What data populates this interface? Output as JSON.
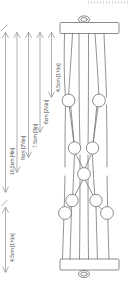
{
  "diagram": {
    "orientation": "rotated-90-ccw",
    "units": "cm [in]",
    "line_color": "#6e6e6e",
    "fill_color": "#ffffff",
    "text_color": "#4a4a4a",
    "background": "#ffffff"
  },
  "dimensions": [
    {
      "id": "dim-1",
      "label": "10.5cm [4in]",
      "cm": 10.5,
      "inches": "4in",
      "span": "overall-upper"
    },
    {
      "id": "dim-2",
      "label": "9cm [3½in]",
      "cm": 9.0,
      "inches": "3½in",
      "span": "to-lower-bead-row"
    },
    {
      "id": "dim-3",
      "label": "7.5cm [3in]",
      "cm": 7.5,
      "inches": "3in",
      "span": "to-centre-bead"
    },
    {
      "id": "dim-4",
      "label": "6cm [2¼in]",
      "cm": 6.0,
      "inches": "2¼in",
      "span": "to-upper-mid-beads"
    },
    {
      "id": "dim-5",
      "label": "4.5cm [1¾in]",
      "cm": 4.5,
      "inches": "1¾in",
      "span": "to-top-bead-row"
    },
    {
      "id": "dim-6",
      "label": "4.5cm [1¾in]",
      "cm": 4.5,
      "inches": "1¾in",
      "span": "bottom-section"
    }
  ],
  "components": {
    "top_bar": "wooden-dowel-bar",
    "bottom_bar": "wooden-dowel-bar",
    "top_loop": "hanging-loop",
    "bottom_loop": "hanging-loop",
    "cord_count": 4,
    "bead_rows": [
      {
        "row": 1,
        "beads": 2
      },
      {
        "row": 2,
        "beads": 2
      },
      {
        "row": 3,
        "beads": 1
      },
      {
        "row": 4,
        "beads": 2
      },
      {
        "row": 5,
        "beads": 2
      }
    ],
    "bead_total": 9
  }
}
